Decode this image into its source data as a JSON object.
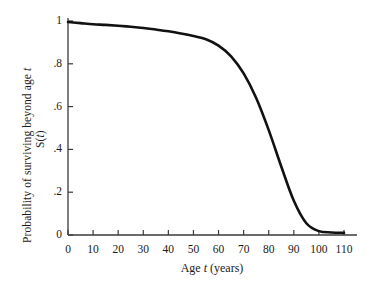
{
  "chart_data": {
    "type": "line",
    "title": "",
    "xlabel": "Age t (years)",
    "ylabel": "S(t) Probability of surviving beyond age t",
    "ylabel_lines": [
      "S(t)",
      "Probability of surviving beyond age t"
    ],
    "xlim": [
      0,
      110
    ],
    "ylim": [
      0,
      1
    ],
    "grid": false,
    "legend": "none",
    "xticks": [
      0,
      10,
      20,
      30,
      40,
      50,
      60,
      70,
      80,
      90,
      100,
      110
    ],
    "xtick_labels": [
      "0",
      "10",
      "20",
      "30",
      "40",
      "50",
      "60",
      "70",
      "80",
      "90",
      "100",
      "110"
    ],
    "yticks": [
      0,
      0.2,
      0.4,
      0.6,
      0.8,
      1
    ],
    "ytick_labels": [
      "0",
      ".2",
      ".4",
      ".6",
      ".8",
      "1"
    ],
    "series": [
      {
        "name": "S(t)",
        "color": "#111111",
        "x": [
          0,
          5,
          10,
          15,
          20,
          25,
          30,
          35,
          40,
          45,
          50,
          55,
          60,
          65,
          70,
          75,
          80,
          85,
          90,
          95,
          100,
          105,
          110
        ],
        "values": [
          0.995,
          0.99,
          0.985,
          0.982,
          0.978,
          0.973,
          0.967,
          0.96,
          0.952,
          0.942,
          0.93,
          0.915,
          0.885,
          0.835,
          0.755,
          0.64,
          0.49,
          0.32,
          0.16,
          0.055,
          0.018,
          0.012,
          0.01
        ]
      }
    ],
    "annotations": []
  },
  "axis": {
    "x_title": "Age ",
    "x_title_italic": "t",
    "x_title_tail": " (years)",
    "y_title_inner_prefix": "S(",
    "y_title_inner_italic": "t",
    "y_title_inner_suffix": ")",
    "y_title_outer_prefix": "Probability of surviving beyond age ",
    "y_title_outer_italic": "t"
  },
  "style": {
    "axis_color": "#3a3a3a",
    "curve_color": "#111111",
    "background": "#ffffff",
    "text_color": "#1a1a1a"
  }
}
